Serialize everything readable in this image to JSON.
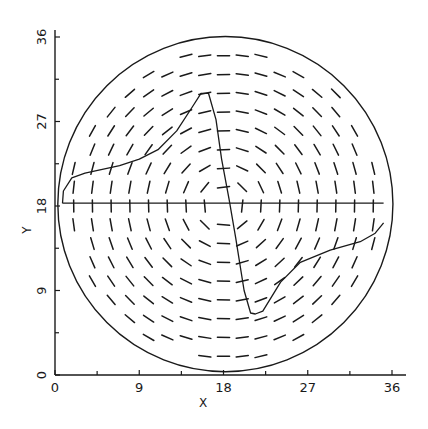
{
  "chart_data": {
    "type": "line",
    "title": "",
    "xlabel": "X",
    "ylabel": "Y",
    "xlim": [
      0,
      36
    ],
    "ylim": [
      0,
      36
    ],
    "x_ticks": [
      0,
      9,
      18,
      27,
      36
    ],
    "y_ticks": [
      0,
      9,
      18,
      27,
      36
    ],
    "x_tick_labels": [
      "0",
      "9",
      "18",
      "27",
      "36"
    ],
    "y_tick_labels": [
      "0",
      "9",
      "18",
      "27",
      "36"
    ],
    "minor_tick_step": 4.5,
    "grid": false,
    "legend": null,
    "boundary_circle": {
      "center": [
        18.2,
        18.2
      ],
      "radius": 17.9
    },
    "vector_field": {
      "description": "tangential (circulating) direction field on a regular grid, drawn as short dashes",
      "grid_step": 2,
      "x_range": [
        2,
        34
      ],
      "y_range": [
        2,
        34
      ],
      "center": [
        18.2,
        18.2
      ],
      "dash_length": 1.3
    },
    "series": [
      {
        "name": "velocity-profile",
        "x": [
          0.8,
          0.9,
          1.8,
          3.2,
          6.9,
          9.0,
          11.0,
          13.0,
          14.7,
          15.6,
          16.4,
          17.2,
          17.8,
          18.6,
          19.3,
          20.2,
          20.9,
          21.4,
          22.2,
          24.1,
          26.2,
          29.4,
          32.6,
          34.2,
          35.1
        ],
        "y": [
          18.3,
          19.6,
          21.0,
          21.5,
          22.3,
          23.0,
          24.0,
          26.0,
          28.6,
          30.0,
          30.0,
          27.2,
          23.0,
          18.7,
          14.6,
          9.0,
          6.6,
          6.5,
          6.8,
          9.9,
          12.0,
          13.3,
          14.2,
          15.1,
          16.2
        ]
      },
      {
        "name": "horizontal-reference-line",
        "x": [
          0.8,
          35.1
        ],
        "y": [
          18.3,
          18.3
        ]
      }
    ]
  }
}
